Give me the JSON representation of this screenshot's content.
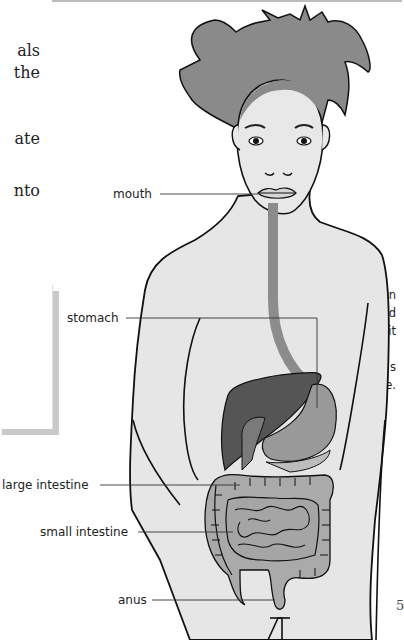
{
  "page": {
    "page_number_fragment": "5"
  },
  "body_text": {
    "lines": [
      {
        "text": "als",
        "top": 0
      },
      {
        "text": "the",
        "top": 22
      },
      {
        "text": "ate",
        "top": 88
      },
      {
        "text": "nto",
        "top": 140
      }
    ]
  },
  "sidebar": {
    "lines": [
      {
        "text": "in",
        "top": 0
      },
      {
        "text": "food",
        "top": 18
      },
      {
        "text": "re it",
        "top": 36
      },
      {
        "text": "s",
        "top": 72
      },
      {
        "text": "ne.",
        "top": 90
      }
    ]
  },
  "figure": {
    "labels": {
      "mouth": "mouth",
      "stomach": "stomach",
      "large_intestine": "large intestine",
      "small_intestine": "small intestine",
      "anus": "anus"
    },
    "colors": {
      "skin": "#e6e6e6",
      "hair": "#8a8a8a",
      "outline": "#111111",
      "esophagus": "#8c8c8c",
      "liver": "#555555",
      "stomach": "#999999",
      "intestines": "#aaaaaa",
      "leader_line": "#333333"
    }
  }
}
